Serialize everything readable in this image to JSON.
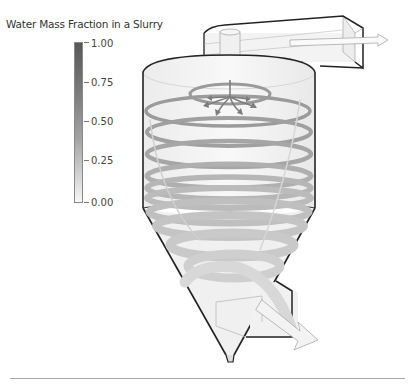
{
  "legend": {
    "title": "Water Mass Fraction in a Slurry",
    "ticks": [
      {
        "label": "1.00",
        "value": 1.0
      },
      {
        "label": "0.75",
        "value": 0.75
      },
      {
        "label": "0.50",
        "value": 0.5
      },
      {
        "label": "0.25",
        "value": 0.25
      },
      {
        "label": "0.00",
        "value": 0.0
      }
    ],
    "colormap": {
      "high": "#585858",
      "low": "#f7f7f7"
    }
  },
  "diagram": {
    "parts": [
      "overflow-outlet-duct",
      "vortex-finder",
      "cylindrical-body",
      "conical-section",
      "underflow-apex",
      "inlet-box",
      "swirl-streamlines",
      "flow-arrows"
    ],
    "colors": {
      "outline": "#222222",
      "fill": "#f4f4f4",
      "streamline": "#b0b0b0",
      "arrow": "#8a8a8a"
    }
  }
}
